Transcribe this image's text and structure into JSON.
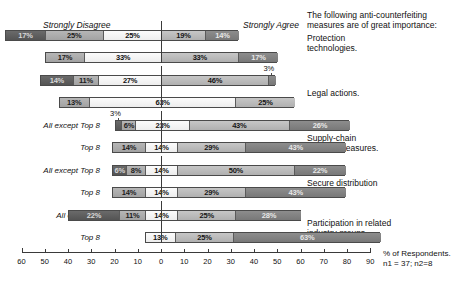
{
  "header": {
    "left_anchor": "Strongly Disagree",
    "right_anchor": "Strongly Agree",
    "prompt_line1": "The following anti-counterfeiting",
    "prompt_line2": "measures are of great importance:"
  },
  "axis": {
    "label_line1": "% of Respondents.",
    "label_line2": "n1 = 37; n2=8",
    "ticks": [
      "60",
      "50",
      "40",
      "30",
      "20",
      "10",
      "0",
      "10",
      "20",
      "30",
      "40",
      "50",
      "60",
      "70",
      "80",
      "90"
    ],
    "left_max": 60,
    "right_max": 90,
    "zero_value": "0"
  },
  "row_labels": {
    "all_except_long": "All except Top 8",
    "all_except_short": "All ex. Top 8",
    "top8": "Top 8"
  },
  "chart_data": {
    "type": "bar",
    "title": "The following anti-counterfeiting measures are of great importance:",
    "subtype": "diverging-stacked-likert",
    "xlabel": "% of Respondents.",
    "ylabel": "",
    "xlim": [
      -60,
      90
    ],
    "grid": false,
    "legend_position": "none",
    "anchors": {
      "left": "Strongly Disagree",
      "right": "Strongly Agree"
    },
    "sample_sizes": "n1 = 37; n2=8",
    "likert_levels": [
      "Strongly Disagree",
      "Disagree",
      "Neutral",
      "Agree",
      "Strongly Agree"
    ],
    "groups": [
      {
        "category": "Protection technologies.",
        "category_lines": [
          "Protection",
          "technologies."
        ],
        "rows": [
          {
            "label": "All ex. Top 8",
            "label_variant": "short",
            "negative_total": 67,
            "values": [
              17,
              25,
              25,
              19,
              14
            ],
            "labels": [
              "17%",
              "25%",
              "25%",
              "19%",
              "14%"
            ],
            "callouts": []
          },
          {
            "label": "Top 8",
            "label_variant": "top8",
            "negative_total": 50,
            "values": [
              0,
              17,
              33,
              33,
              17
            ],
            "labels": [
              "",
              "17%",
              "33%",
              "33%",
              "17%"
            ],
            "callouts": []
          }
        ]
      },
      {
        "category": "Legal actions.",
        "category_lines": [
          "Legal actions."
        ],
        "rows": [
          {
            "label": "All ex. Top 8",
            "label_variant": "short",
            "negative_total": 52,
            "values": [
              14,
              11,
              27,
              46,
              3
            ],
            "labels": [
              "14%",
              "11%",
              "27%",
              "46%",
              "3%"
            ],
            "callouts": [
              {
                "index": 4,
                "text": "3%"
              }
            ]
          },
          {
            "label": "Top 8",
            "label_variant": "top8",
            "negative_total": 44,
            "values": [
              0,
              13,
              63,
              25,
              0
            ],
            "labels": [
              "",
              "13%",
              "63%",
              "25%",
              ""
            ],
            "callouts": []
          }
        ]
      },
      {
        "category": "Supply-chain security measures.",
        "category_lines": [
          "Supply-chain",
          "security measures."
        ],
        "rows": [
          {
            "label": "All except Top 8",
            "label_variant": "long",
            "negative_total": 20,
            "values": [
              3,
              6,
              23,
              43,
              26
            ],
            "labels": [
              "3%",
              "6%",
              "23%",
              "43%",
              "26%"
            ],
            "callouts": [
              {
                "index": 0,
                "text": "3%"
              }
            ]
          },
          {
            "label": "Top 8",
            "label_variant": "top8",
            "negative_total": 21,
            "values": [
              0,
              14,
              14,
              29,
              43
            ],
            "labels": [
              "",
              "14%",
              "14%",
              "29%",
              "43%"
            ],
            "callouts": []
          }
        ]
      },
      {
        "category": "Secure distribution systems.",
        "category_lines": [
          "Secure distribution",
          "systems."
        ],
        "rows": [
          {
            "label": "All except Top 8",
            "label_variant": "long",
            "negative_total": 21,
            "values": [
              6,
              8,
              14,
              50,
              22
            ],
            "labels": [
              "6%",
              "8%",
              "14%",
              "50%",
              "22%"
            ],
            "callouts": []
          },
          {
            "label": "Top 8",
            "label_variant": "top8",
            "negative_total": 21,
            "values": [
              0,
              14,
              14,
              29,
              43
            ],
            "labels": [
              "",
              "14%",
              "14%",
              "29%",
              "43%"
            ],
            "callouts": []
          }
        ]
      },
      {
        "category": "Participation in related industry groups.",
        "category_lines": [
          "Participation in related",
          "industry groups."
        ],
        "rows": [
          {
            "label": "All ex. Top 8",
            "label_variant": "short",
            "negative_total": 40,
            "values": [
              22,
              11,
              14,
              25,
              28
            ],
            "labels": [
              "22%",
              "11%",
              "14%",
              "25%",
              "28%"
            ],
            "callouts": []
          },
          {
            "label": "Top 8",
            "label_variant": "top8",
            "negative_total": 7,
            "values": [
              0,
              0,
              13,
              25,
              63
            ],
            "labels": [
              "",
              "",
              "13%",
              "25%",
              "63%"
            ],
            "callouts": []
          }
        ]
      }
    ]
  }
}
